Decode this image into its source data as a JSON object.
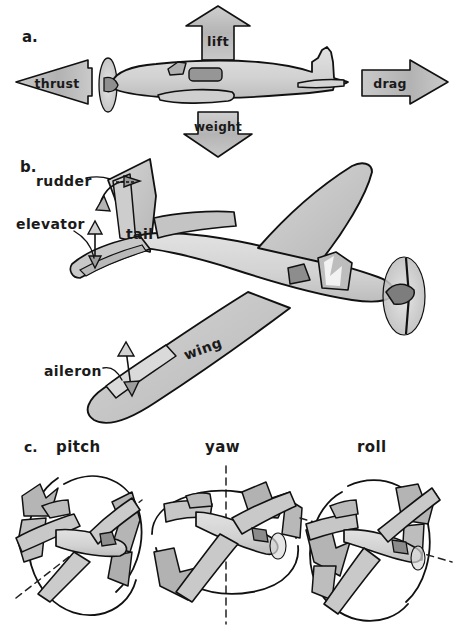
{
  "figure": {
    "background_color": "#ffffff",
    "ink_color": "#111111"
  },
  "palette": {
    "body_light": "#d9d9d9",
    "body_mid": "#c2c2c2",
    "body_dark": "#a8a8a8",
    "window_dark": "#8c8c8c",
    "arrow_fill": "#b9b9b9",
    "arrow_fill_light": "#d2d2d2",
    "prop_disc": "#cfcfcf",
    "outline": "#111111"
  },
  "panels": [
    {
      "id": "a",
      "letter": "a.",
      "caption": "",
      "description": "Side view aeroplane with four force arrows",
      "forces": [
        {
          "name": "lift",
          "label": "lift",
          "direction": "up",
          "x": 218,
          "y": 40
        },
        {
          "name": "weight",
          "label": "weight",
          "direction": "down",
          "x": 218,
          "y": 133
        },
        {
          "name": "thrust",
          "label": "thrust",
          "direction": "left",
          "x": 55,
          "y": 82
        },
        {
          "name": "drag",
          "label": "drag",
          "direction": "right",
          "x": 398,
          "y": 82
        }
      ]
    },
    {
      "id": "b",
      "letter": "b.",
      "caption": "",
      "description": "Three-quarter view aeroplane with labelled control surfaces",
      "parts": [
        {
          "name": "rudder",
          "label": "rudder",
          "x": 38,
          "y": 181,
          "has_leader": true,
          "motion": "left-right"
        },
        {
          "name": "elevator",
          "label": "elevator",
          "x": 18,
          "y": 224,
          "has_leader": true,
          "motion": "up-down"
        },
        {
          "name": "tail",
          "label": "tail",
          "x": 127,
          "y": 233,
          "has_leader": false,
          "motion": ""
        },
        {
          "name": "aileron",
          "label": "aileron",
          "x": 47,
          "y": 371,
          "has_leader": true,
          "motion": "up-down"
        },
        {
          "name": "wing",
          "label": "wing",
          "x": 190,
          "y": 352,
          "has_leader": false,
          "motion": ""
        }
      ]
    },
    {
      "id": "c",
      "letter": "c.",
      "caption": "",
      "description": "Three aeroplanes showing rotation about each axis",
      "axes": [
        {
          "name": "pitch",
          "label": "pitch",
          "x": 65,
          "y": 447,
          "axis": "lateral",
          "rotation_plane": "vertical-circle"
        },
        {
          "name": "yaw",
          "label": "yaw",
          "x": 222,
          "y": 447,
          "axis": "vertical",
          "rotation_plane": "horizontal-ellipse"
        },
        {
          "name": "roll",
          "label": "roll",
          "x": 375,
          "y": 447,
          "axis": "longitudinal",
          "rotation_plane": "vertical-circle"
        }
      ]
    }
  ]
}
